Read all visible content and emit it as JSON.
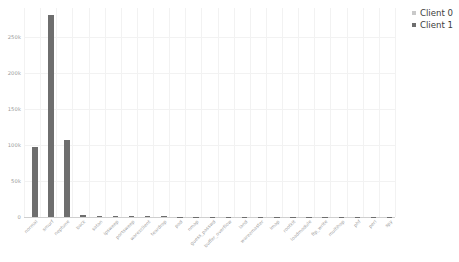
{
  "chart_data": {
    "type": "bar",
    "title": "",
    "subtitle": "",
    "xlabel": "",
    "ylabel": "",
    "grid": true,
    "legend_position": "top-right",
    "ylim": [
      0,
      290000
    ],
    "yticks": [
      0,
      50000,
      100000,
      150000,
      200000,
      250000
    ],
    "ytick_labels": [
      "0",
      "50k",
      "100k",
      "150k",
      "200k",
      "250k"
    ],
    "categories": [
      "normal",
      "smurf",
      "neptune",
      "back",
      "satan",
      "ipsweep",
      "portsweep",
      "warezclient",
      "teardrop",
      "pod",
      "nmap",
      "guess_passwd",
      "buffer_overflow",
      "land",
      "warezmaster",
      "imap",
      "rootkit",
      "loadmodule",
      "ftp_write",
      "multihop",
      "phf",
      "perl",
      "spy"
    ],
    "series": [
      {
        "name": "Client 0",
        "color": "#c9c9c9",
        "values": [
          0,
          0,
          0,
          0,
          0,
          0,
          0,
          0,
          0,
          0,
          0,
          0,
          0,
          0,
          0,
          0,
          0,
          0,
          0,
          0,
          0,
          0,
          0
        ]
      },
      {
        "name": "Client 1",
        "color": "#6e6e6e",
        "values": [
          97278,
          280790,
          107201,
          2203,
          1589,
          1247,
          1040,
          1020,
          979,
          264,
          231,
          53,
          30,
          21,
          20,
          12,
          10,
          9,
          8,
          7,
          4,
          3,
          2
        ]
      }
    ]
  },
  "legend": {
    "items": [
      {
        "label": "Client 0",
        "color": "#c9c9c9"
      },
      {
        "label": "Client 1",
        "color": "#6e6e6e"
      }
    ]
  }
}
